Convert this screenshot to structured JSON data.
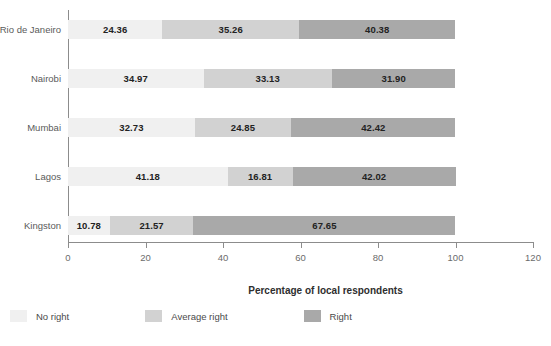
{
  "chart_data": {
    "type": "bar",
    "orientation": "horizontal",
    "stacked": true,
    "title": "",
    "xlabel": "Percentage of local respondents",
    "ylabel": "",
    "xlim": [
      0,
      120
    ],
    "xticks": [
      0,
      20,
      40,
      60,
      80,
      100,
      120
    ],
    "grid": false,
    "legend_position": "bottom-left",
    "categories": [
      "Rio de Janeiro",
      "Nairobi",
      "Mumbai",
      "Lagos",
      "Kingston"
    ],
    "series": [
      {
        "name": "No right",
        "color": "#f0f0f0",
        "values": [
          24.36,
          34.97,
          32.73,
          41.18,
          10.78
        ]
      },
      {
        "name": "Average right",
        "color": "#d2d2d2",
        "values": [
          35.26,
          33.13,
          24.85,
          16.81,
          21.57
        ]
      },
      {
        "name": "Right",
        "color": "#a9a9a9",
        "values": [
          40.38,
          31.9,
          42.42,
          42.02,
          67.65
        ]
      }
    ]
  },
  "axis": {
    "tick_labels": [
      "0",
      "20",
      "40",
      "60",
      "80",
      "100",
      "120"
    ],
    "x_title": "Percentage of local respondents"
  },
  "rows": [
    {
      "label": "Rio de Janeiro",
      "segments": [
        {
          "series": "No right",
          "value": "24.36"
        },
        {
          "series": "Average right",
          "value": "35.26"
        },
        {
          "series": "Right",
          "value": "40.38"
        }
      ]
    },
    {
      "label": "Nairobi",
      "segments": [
        {
          "series": "No right",
          "value": "34.97"
        },
        {
          "series": "Average right",
          "value": "33.13"
        },
        {
          "series": "Right",
          "value": "31.90"
        }
      ]
    },
    {
      "label": "Mumbai",
      "segments": [
        {
          "series": "No right",
          "value": "32.73"
        },
        {
          "series": "Average right",
          "value": "24.85"
        },
        {
          "series": "Right",
          "value": "42.42"
        }
      ]
    },
    {
      "label": "Lagos",
      "segments": [
        {
          "series": "No right",
          "value": "41.18"
        },
        {
          "series": "Average right",
          "value": "16.81"
        },
        {
          "series": "Right",
          "value": "42.02"
        }
      ]
    },
    {
      "label": "Kingston",
      "segments": [
        {
          "series": "No right",
          "value": "10.78"
        },
        {
          "series": "Average right",
          "value": "21.57"
        },
        {
          "series": "Right",
          "value": "67.65"
        }
      ]
    }
  ],
  "legend": [
    {
      "label": "No right",
      "color": "#f0f0f0"
    },
    {
      "label": "Average right",
      "color": "#d2d2d2"
    },
    {
      "label": "Right",
      "color": "#a9a9a9"
    }
  ]
}
